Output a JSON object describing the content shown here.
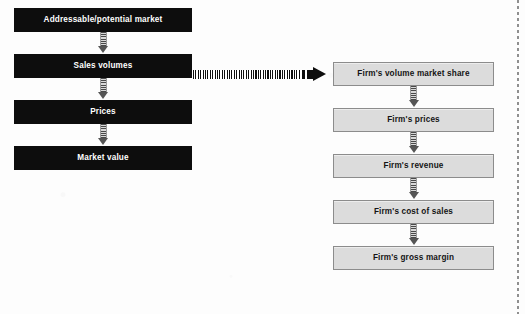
{
  "diagram": {
    "type": "flowchart",
    "title": "",
    "left_column": {
      "name": "market-level-chain",
      "style": "dark-filled",
      "boxes": [
        {
          "label": "Addressable/potential market"
        },
        {
          "label": "Sales volumes"
        },
        {
          "label": "Prices"
        },
        {
          "label": "Market value"
        }
      ]
    },
    "right_column": {
      "name": "firm-level-chain",
      "style": "light-filled",
      "boxes": [
        {
          "label": "Firm's volume market share"
        },
        {
          "label": "Firm's prices"
        },
        {
          "label": "Firm's revenue"
        },
        {
          "label": "Firm's cost of sales"
        },
        {
          "label": "Firm's gross margin"
        }
      ]
    },
    "cross_link": {
      "name": "sales-volumes-to-firm-share-arrow",
      "from": "Sales volumes",
      "to": "Firm's volume market share",
      "style": "striped-horizontal-arrow"
    },
    "connectors": {
      "style": "striped-vertical-arrow",
      "direction": "downward"
    },
    "colors": {
      "dark_box_fill": "#0d0d0d",
      "dark_box_text": "#ffffff",
      "light_box_fill": "#dcdcdc",
      "light_box_border": "#8c8c8c",
      "light_box_text": "#141414",
      "arrow": "#0d0d0d",
      "background": "#fdfdfd",
      "margin_rule": "#8f8f8f"
    }
  }
}
